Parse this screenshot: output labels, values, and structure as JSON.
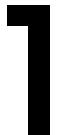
{
  "glyph": {
    "character": "ד",
    "description": "black dalet-like glyph",
    "color": "#000000",
    "background": "#ffffff"
  }
}
